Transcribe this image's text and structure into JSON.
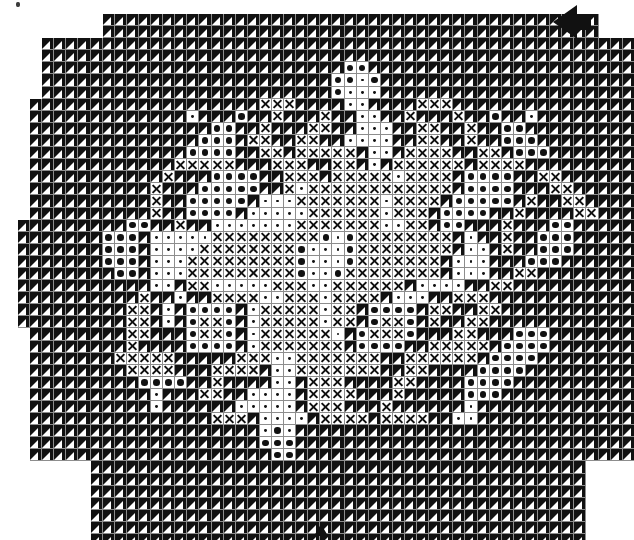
{
  "document": {
    "title": "Cross-stitch / filet needlework pattern chart",
    "kind": "pattern-chart"
  },
  "chart_data": {
    "type": "heatmap",
    "xlabel": "",
    "ylabel": "",
    "grid": true,
    "legend_position": "none",
    "cell_size_px": 12.1,
    "columns": 52,
    "rows": 44,
    "origin": {
      "x": 18,
      "y": 14
    },
    "symbol_key": {
      "F": "filled-dark-stitch",
      "O": "large-dot-stitch",
      "D": "small-dot-stitch",
      "X": "cross-stitch",
      ".": "empty-stitch",
      " ": "outside-pattern"
    },
    "palette": {
      "dark": "#111111",
      "background": "#ffffff",
      "gridline": "#8d8d8d"
    },
    "markers": [
      {
        "name": "center-marker-right",
        "direction": "left",
        "col": 52,
        "row": 1
      },
      {
        "name": "center-marker-bottom",
        "direction": "up",
        "col": 25,
        "row": 44
      }
    ],
    "rows_data": [
      "       FFFFFFFFFFFFFFFFFFFFFFFFFFFFFFFFFFFFFFFFF     ",
      "       FFFFFFFFFFFFFFFFFFFFFFFFFFFFFFFFFFFFFFFFF     ",
      "  FFFFFFFFFFFFFFFFFFFFFFFFFFFFFFFFFFFFFFFFFFFFFFFFFF ",
      "  FFFFFFFFFFFFFFFFFFFFFFFFFFFFFFFFFFFFFFFFFFFFFFFFFF ",
      "  FFFFFFFFFFFFFFFFFFFFFFFFFOOFFFFFFFFFFFFFFFFFFFFFFF ",
      "  FFFFFFFFFFFFFFFFFFFFFFFFOODOFFFFFFFFFFFFFFFFFFFFFF ",
      "  FFFFFFFFFFFFFFFFFFFFFFFFODDDFFFFFFFFFFFFFFFFFFFFFF ",
      " FFFFFFFFFFFFFFFFFFFXXXFFFFDDFFFFXXXFFFFFFFFFFFFFFFF ",
      " FFFFFFFFFFFFFDFFFOFFXFFFXFFDDFFXFFFXFFOFFDFFFFFFFFF ",
      " FFFFFFFFFFFFFFFOOFFXFFFXXFFDDDFFXXFFXFFOOFFFFFFFFFF ",
      " FFFFFFFFFFFFFFOOOFXXFFXXFFDDDDFFXXFFXFFOOOFFFFFFFFF ",
      " FFFFFFFFFFFFFOOOOFFXXFXXXXXFDDFXXXXFFXXFOOOFFFFFFFF ",
      " FFFFFFFFFFFFXXXXXFFFXXXFFXXFDFXXXXXXFXXXXFFFFFFFFFF ",
      " FFFFFFFFFFFXFFFOOOOFFXXXFXXXXXDXXXXFOOOOFFXXFFFFFFF ",
      " FFFFFFFFFFXFFFOOOOOFFXDXXXXXXXXXXXXFOOOOFFFXXFFFFFF ",
      " FFFFFFFFFFXFFOOOOOFDDDXXXXXXXDXXXXFOOOOOFXFFXXFFFFF ",
      " FFFFFFFFFFXFFOOOOFDDDDDXXXXXXDXXXFOOOOFFXFFFFXXFFFF ",
      "FFFFFFFFFOOFFXFFDDDDDDDXXXXXXXDDXXFOOFFFXFFFOOFFFFFFF",
      "FFFFFFFOOOFDDDDDXXXXXXXXXODOXXXXXXXXFDFFXFFOOOFFFFFFF",
      "FFFFFFFOOOFDDDDXXXXXXXXODDDOXXXXXXXXFDDFXFFOOOFFFFFFF",
      "FFFFFFFOOOFDDDXXXXXXXXXODDDOXXXXXXXFDDDFFFOOOFFFFFFFF",
      "FFFFFFFFOOFDDDXXXXXXXXXODDOXXXXXXXXFDDDFFXXFFFFFFFFFF",
      "FFFFFFFFFFFDDFXXDDDDDXXXDDXXXXXXFDDDDFFXXFFFFFFFFFFFF",
      "FFFFFFFFFFXFFDFFXXXXDDXXXDXXXXFDDDFFXXXFFFFFFFFFFFFFF",
      "FFFFFFFFFXXFDFOOOOFDXXXXXDXXFOOOOFXXFFXXFFFFFFFFFFFFF",
      "FFFFFFFFFXXFDFOXXOFDXXXXXDXXFOXXOFXFFXXFFFFFFFFFFFFFF",
      " FFFFFFFFXXFFFOXXOFDXXXXXXDFOXXXOFFFXXFFFOOOFFFFFFFFF",
      " FFFFFFFFXFFFFOOOOFDXXXXXXXFOOOOFFXXXXXFOOOOFFFFFFFFF",
      " FFFFFFFXXXXXFFFFFXXXDDXXXXXXXFFXXXXXXFOOOOFFFFFFFFFF",
      " FFFFFFFFXXXXFFFXXXXFDDXXXXXXXFFXXFFFFOOOOFFFFFFFFFFF",
      " FFFFFFFFFOOOOFFXFFFFDDFXXXFFFFXXFFFFOOOOFFFFFFFFFFFF",
      " FFFFFFFFFFDFFFXXFFDDDDFXXXXFFFXFFFFFOOOFFFFFFFFFFFFF",
      " FFFFFFFFFFDFFFFFFDDDDDFXXXFFFXFFFFFFDFFFFFFFFFFFFFFF",
      " FFFFFFFFFFFFFFFXXXFDDDDFXXXXFXXXXFFDDFFFFFFFFFFFFFFF",
      " FFFFFFFFFFFFFFFFFFFDODFFFFFFFFFFFFFFFFFFFFFFFFFFFFF ",
      " FFFFFFFFFFFFFFFFFFFOOOFFFFFFFFFFFFFFFFFFFFFFFFFFFFF ",
      " FFFFFFFFFFFFFFFFFFFFOOFFFFFFFFFFFFFFFFFFFFFFFFFFFFF ",
      "      FFFFFFFFFFFFFFFFFFFFFFFFFFFFFFFFFFFFFFFFF      ",
      "      FFFFFFFFFFFFFFFFFFFFFFFFFFFFFFFFFFFFFFFFF      ",
      "      FFFFFFFFFFFFFFFFFFFFFFFFFFFFFFFFFFFFFFFFF      ",
      "      FFFFFFFFFFFFFFFFFFFFFFFFFFFFFFFFFFFFFFFFF      ",
      "      FFFFFFFFFFFFFFFFFFFFFFFFFFFFFFFFFFFFFFFFF      ",
      "      FFFFFFFFFFFFFFFFFFFFFFFFFFFFFFFFFFFFFFFFF      ",
      "      FFFFFFFFFFFFFFFFFFFFFFFFFFFFFFFFFFFFFFFFF      "
    ]
  }
}
